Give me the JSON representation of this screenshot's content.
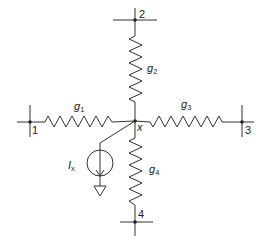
{
  "diagram": {
    "type": "circuit",
    "central_node": {
      "label": "x"
    },
    "nodes": [
      {
        "id": "1",
        "label": "1"
      },
      {
        "id": "2",
        "label": "2"
      },
      {
        "id": "3",
        "label": "3"
      },
      {
        "id": "4",
        "label": "4"
      }
    ],
    "conductances": [
      {
        "label": "g",
        "sub": "1",
        "from": "1",
        "to": "x"
      },
      {
        "label": "g",
        "sub": "2",
        "from": "2",
        "to": "x"
      },
      {
        "label": "g",
        "sub": "3",
        "from": "x",
        "to": "3"
      },
      {
        "label": "g",
        "sub": "4",
        "from": "x",
        "to": "4"
      }
    ],
    "current_source": {
      "label": "I",
      "sub": "x",
      "from": "x",
      "to": "ground",
      "direction": "down"
    },
    "colors": {
      "line": "#333333",
      "background": "#ffffff"
    }
  }
}
